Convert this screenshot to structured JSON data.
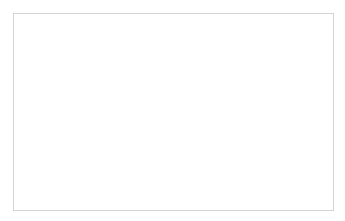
{
  "chart_data": {
    "type": "bar",
    "categories": [
      "Medical Professional",
      "Patient",
      "Student",
      "Other Avatars"
    ],
    "category_lines": [
      [
        "Medical",
        "Professional"
      ],
      [
        "Patient"
      ],
      [
        "Student"
      ],
      [
        "Other Avatars"
      ]
    ],
    "values": [
      13,
      11,
      28,
      6
    ],
    "data_labels": [
      "13",
      "11",
      "28",
      "6"
    ],
    "xlabel": "",
    "ylabel": "",
    "ylim": [
      0,
      30
    ],
    "yticks": [
      "0",
      "5",
      "10",
      "15",
      "20",
      "25",
      "30"
    ],
    "grid": true,
    "legend": "none",
    "bar_color": "#8e8e8e"
  }
}
